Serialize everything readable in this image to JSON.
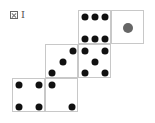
{
  "caption": {
    "icon": "figure-mark-icon",
    "label": "I"
  },
  "net": {
    "cell_size": 33,
    "faces": [
      {
        "id": "six",
        "value": 6,
        "x": 78,
        "y": 10,
        "pips": [
          [
            6,
            6
          ],
          [
            16,
            6
          ],
          [
            26,
            6
          ],
          [
            6,
            28
          ],
          [
            16,
            28
          ],
          [
            26,
            28
          ]
        ],
        "color": "#111111"
      },
      {
        "id": "one",
        "value": 1,
        "x": 111,
        "y": 10,
        "pips": [
          [
            16,
            17
          ]
        ],
        "color": "#666666"
      },
      {
        "id": "three",
        "value": 3,
        "x": 45,
        "y": 44,
        "pips": [
          [
            27,
            6
          ],
          [
            17,
            17
          ],
          [
            6,
            28
          ]
        ],
        "color": "#111111"
      },
      {
        "id": "five",
        "value": 5,
        "x": 78,
        "y": 44,
        "pips": [
          [
            6,
            6
          ],
          [
            26,
            6
          ],
          [
            16,
            17
          ],
          [
            6,
            28
          ],
          [
            26,
            28
          ]
        ],
        "color": "#111111"
      },
      {
        "id": "four",
        "value": 4,
        "x": 12,
        "y": 78,
        "pips": [
          [
            6,
            6
          ],
          [
            26,
            6
          ],
          [
            6,
            28
          ],
          [
            26,
            28
          ]
        ],
        "color": "#111111"
      },
      {
        "id": "two",
        "value": 2,
        "x": 45,
        "y": 78,
        "pips": [
          [
            6,
            6
          ],
          [
            26,
            28
          ]
        ],
        "color": "#111111"
      }
    ]
  }
}
